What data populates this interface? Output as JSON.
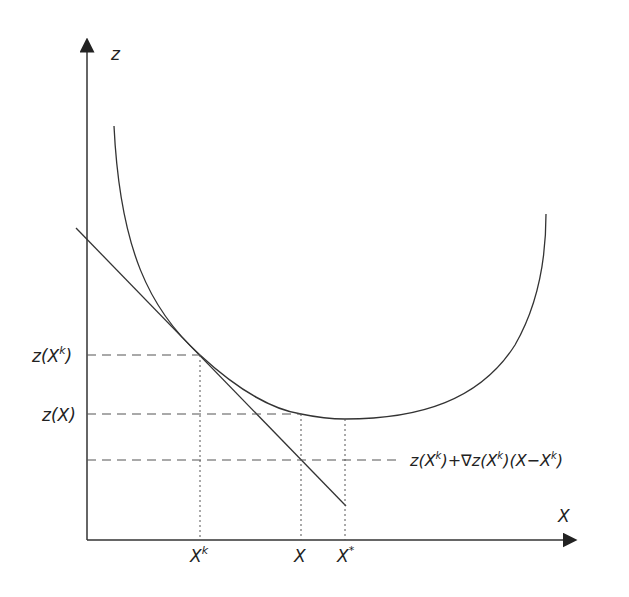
{
  "figure": {
    "type": "diagram",
    "axes": {
      "y_label": "z",
      "x_label": "X"
    },
    "y_tick_labels": {
      "z_xk": "z(X",
      "z_xk_sup": "k",
      "z_xk_close": ")",
      "z_x": "z(X)"
    },
    "x_tick_labels": {
      "xk": "X",
      "xk_sup": "k",
      "x": "X",
      "xstar": "X",
      "xstar_sup": "*"
    },
    "tangent_label": {
      "part1": "z(X",
      "sup1": "k",
      "part2": ")+∇z(X",
      "sup2": "k",
      "part3": ")(X−X",
      "sup3": "k",
      "part4": ")"
    },
    "colors": {
      "stroke": "#333333",
      "dashed": "#555555",
      "background": "#ffffff"
    }
  }
}
